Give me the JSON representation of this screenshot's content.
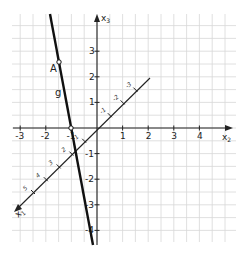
{
  "diagram": {
    "type": "3d-coordinate-system-oblique",
    "axes": {
      "x2": {
        "label": "x",
        "subscript": "2",
        "ticks": [
          "-3",
          "-2",
          "-1",
          "1",
          "2",
          "3",
          "4"
        ]
      },
      "x3": {
        "label": "x",
        "subscript": "3",
        "ticks": [
          "3",
          "2",
          "1",
          "-1",
          "-2",
          "-3",
          "-4"
        ]
      },
      "x1": {
        "label": "x",
        "subscript": "1",
        "ticks_positive": [
          "1",
          "2",
          "3",
          "4",
          "5"
        ],
        "ticks_negative": [
          "-1",
          "-2",
          "-3"
        ]
      }
    },
    "line": {
      "label": "g",
      "color": "#111111"
    },
    "points": [
      {
        "label": "A",
        "marker": "open-circle"
      },
      {
        "label": "",
        "marker": "open-circle"
      }
    ],
    "colors": {
      "grid": "#d8d8d8",
      "axis": "#222222",
      "line": "#111111",
      "background": "#ffffff"
    }
  }
}
